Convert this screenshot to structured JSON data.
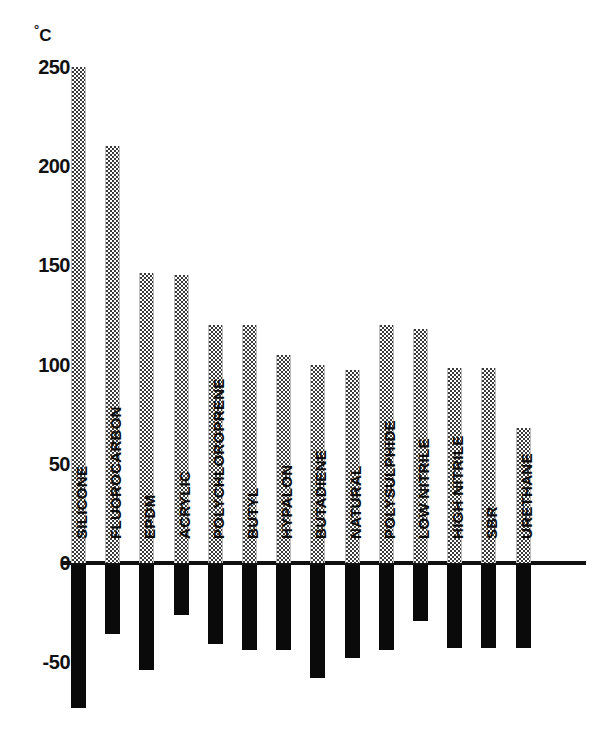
{
  "chart_data": {
    "type": "bar",
    "title": "",
    "subtitle": "",
    "xlabel": "",
    "ylabel": "°C",
    "ylabel_degree": "°",
    "ylabel_unit": "C",
    "ylim": [
      -80,
      265
    ],
    "ytick_values": [
      250,
      200,
      150,
      100,
      50,
      0,
      -50
    ],
    "ytick_labels": [
      "250",
      "200",
      "150",
      "100",
      "50",
      "0",
      "-50"
    ],
    "grid": false,
    "legend": false,
    "legend_position": "none",
    "zero_line": true,
    "categories": [
      "SILICONE",
      "FLUOROCARBON",
      "EPDM",
      "ACRYLIC",
      "POLYCHLOROPRENE",
      "BUTYL",
      "HYPALON",
      "BUTADIENE",
      "NATURAL",
      "POLYSULPHIDE",
      "LOW NITRILE",
      "HIGH NITRILE",
      "SBR",
      "URETHANE"
    ],
    "series": [
      {
        "name": "Maximum service temperature",
        "style": "stippled-grey",
        "color": "#3a3a3a",
        "values": [
          250,
          210,
          146,
          145,
          120,
          120,
          105,
          100,
          97,
          120,
          118,
          98,
          98,
          68
        ]
      },
      {
        "name": "Minimum service temperature",
        "style": "solid-black",
        "color": "#0a0a0a",
        "values": [
          -72,
          -35,
          -53,
          -25,
          -40,
          -43,
          -43,
          -57,
          -47,
          -43,
          -28,
          -42,
          -42,
          -42
        ]
      }
    ]
  },
  "axis": {
    "unit_degree": "°",
    "unit_letter": "C"
  }
}
